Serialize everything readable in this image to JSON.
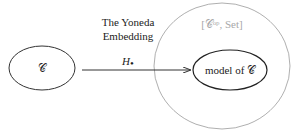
{
  "diagram": {
    "source_node": {
      "label": "𝒞"
    },
    "arrow": {
      "label": "H",
      "subscript": "•"
    },
    "title_line1": "The Yoneda",
    "title_line2": "Embedding",
    "outer_node": {
      "label": "[𝒞ᵒᵖ, Set]"
    },
    "target_node": {
      "label": "model of 𝒞"
    },
    "colors": {
      "stroke": "#333333",
      "outer_stroke": "#9a9a9a",
      "outer_label": "#a8a8a8",
      "text": "#222222"
    }
  }
}
